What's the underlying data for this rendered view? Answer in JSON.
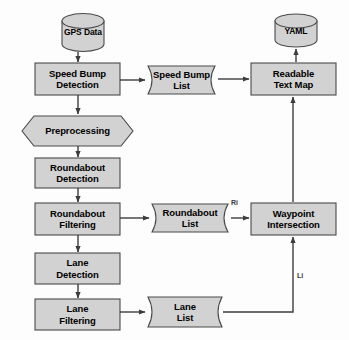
{
  "diagram": {
    "style": {
      "node_fill": "#d2d2d2",
      "node_stroke": "#4a4a4a",
      "background": "#fdfdfd",
      "text_color": "#000000",
      "edge_color": "#3c3c3c"
    },
    "nodes": [
      {
        "id": "gps_data",
        "type": "cylinder",
        "label": "GPS Data",
        "lines": [
          "GPS Data"
        ]
      },
      {
        "id": "speed_bump_detection",
        "type": "process",
        "label": "Speed Bump Detection",
        "lines": [
          "Speed Bump",
          "Detection"
        ]
      },
      {
        "id": "speed_bump_list",
        "type": "data",
        "label": "Speed Bump List",
        "lines": [
          "Speed Bump",
          "List"
        ]
      },
      {
        "id": "readable_text_map",
        "type": "process",
        "label": "Readable Text Map",
        "lines": [
          "Readable",
          "Text Map"
        ]
      },
      {
        "id": "yaml",
        "type": "cylinder",
        "label": "YAML",
        "lines": [
          "YAML"
        ]
      },
      {
        "id": "preprocessing",
        "type": "hexagon",
        "label": "Preprocessing",
        "lines": [
          "Preprocessing"
        ]
      },
      {
        "id": "roundabout_detection",
        "type": "process",
        "label": "Roundabout Detection",
        "lines": [
          "Roundabout",
          "Detection"
        ]
      },
      {
        "id": "roundabout_filtering",
        "type": "process",
        "label": "Roundabout Filtering",
        "lines": [
          "Roundabout",
          "Filtering"
        ]
      },
      {
        "id": "roundabout_list",
        "type": "data",
        "label": "Roundabout List",
        "lines": [
          "Roundabout",
          "List"
        ]
      },
      {
        "id": "waypoint_intersection",
        "type": "process",
        "label": "Waypoint Intersection",
        "lines": [
          "Waypoint",
          "Intersection"
        ]
      },
      {
        "id": "lane_detection",
        "type": "process",
        "label": "Lane Detection",
        "lines": [
          "Lane",
          "Detection"
        ]
      },
      {
        "id": "lane_filtering",
        "type": "process",
        "label": "Lane Filtering",
        "lines": [
          "Lane",
          "Filtering"
        ]
      },
      {
        "id": "lane_list",
        "type": "data",
        "label": "Lane List",
        "lines": [
          "Lane",
          "List"
        ]
      }
    ],
    "edge_labels": [
      {
        "id": "ri",
        "text": "Ri"
      },
      {
        "id": "li",
        "text": "Li"
      }
    ],
    "edges": [
      {
        "from": "gps_data",
        "to": "speed_bump_detection"
      },
      {
        "from": "speed_bump_detection",
        "to": "speed_bump_list"
      },
      {
        "from": "speed_bump_list",
        "to": "readable_text_map"
      },
      {
        "from": "readable_text_map",
        "to": "yaml"
      },
      {
        "from": "speed_bump_detection",
        "to": "preprocessing"
      },
      {
        "from": "preprocessing",
        "to": "roundabout_detection"
      },
      {
        "from": "roundabout_detection",
        "to": "roundabout_filtering"
      },
      {
        "from": "roundabout_filtering",
        "to": "roundabout_list"
      },
      {
        "from": "roundabout_list",
        "to": "waypoint_intersection",
        "label": "Ri"
      },
      {
        "from": "waypoint_intersection",
        "to": "readable_text_map"
      },
      {
        "from": "roundabout_filtering",
        "to": "lane_detection"
      },
      {
        "from": "lane_detection",
        "to": "lane_filtering"
      },
      {
        "from": "lane_filtering",
        "to": "lane_list"
      },
      {
        "from": "lane_list",
        "to": "waypoint_intersection",
        "label": "Li"
      }
    ]
  }
}
